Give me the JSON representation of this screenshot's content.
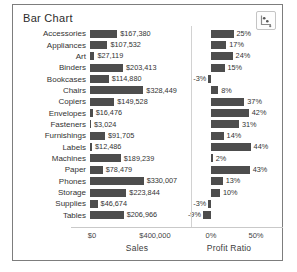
{
  "window": {
    "title": "Bar Chart"
  },
  "toolbar": {
    "chart_type_icon": "scatter-chart-icon"
  },
  "colors": {
    "bar": "#4d4d4d",
    "frame_border": "#7d7d7d",
    "divider": "#d2d2d2",
    "axis_line": "#c9c9c9",
    "text": "#333333"
  },
  "chart_data": {
    "type": "bar",
    "orientation": "horizontal",
    "title": "Bar Chart",
    "grid": false,
    "legend": false,
    "categories": [
      "Accessories",
      "Appliances",
      "Art",
      "Binders",
      "Bookcases",
      "Chairs",
      "Copiers",
      "Envelopes",
      "Fasteners",
      "Furnishings",
      "Labels",
      "Machines",
      "Paper",
      "Phones",
      "Storage",
      "Supplies",
      "Tables"
    ],
    "series": [
      {
        "name": "Sales",
        "axis_title": "Sales",
        "ticks": [
          "$0",
          "$400,000"
        ],
        "tick_values": [
          0,
          400000
        ],
        "values": [
          167380,
          107532,
          27119,
          203413,
          114880,
          328449,
          149528,
          16476,
          3024,
          91705,
          12486,
          189239,
          78479,
          330007,
          223844,
          46674,
          206966
        ],
        "labels": [
          "$167,380",
          "$107,532",
          "$27,119",
          "$203,413",
          "$114,880",
          "$328,449",
          "$149,528",
          "$16,476",
          "$3,024",
          "$91,705",
          "$12,486",
          "$189,239",
          "$78,479",
          "$330,007",
          "$223,844",
          "$46,674",
          "$206,966"
        ]
      },
      {
        "name": "Profit Ratio",
        "axis_title": "Profit Ratio",
        "ticks": [
          "0%",
          "50%"
        ],
        "tick_values": [
          0,
          50
        ],
        "values": [
          25,
          17,
          24,
          15,
          -3,
          8,
          37,
          42,
          31,
          14,
          44,
          2,
          43,
          13,
          10,
          -3,
          -9
        ],
        "labels": [
          "25%",
          "17%",
          "24%",
          "15%",
          "-3%",
          "8%",
          "37%",
          "42%",
          "31%",
          "14%",
          "44%",
          "2%",
          "43%",
          "13%",
          "10%",
          "-3%",
          "-9%"
        ]
      }
    ]
  }
}
